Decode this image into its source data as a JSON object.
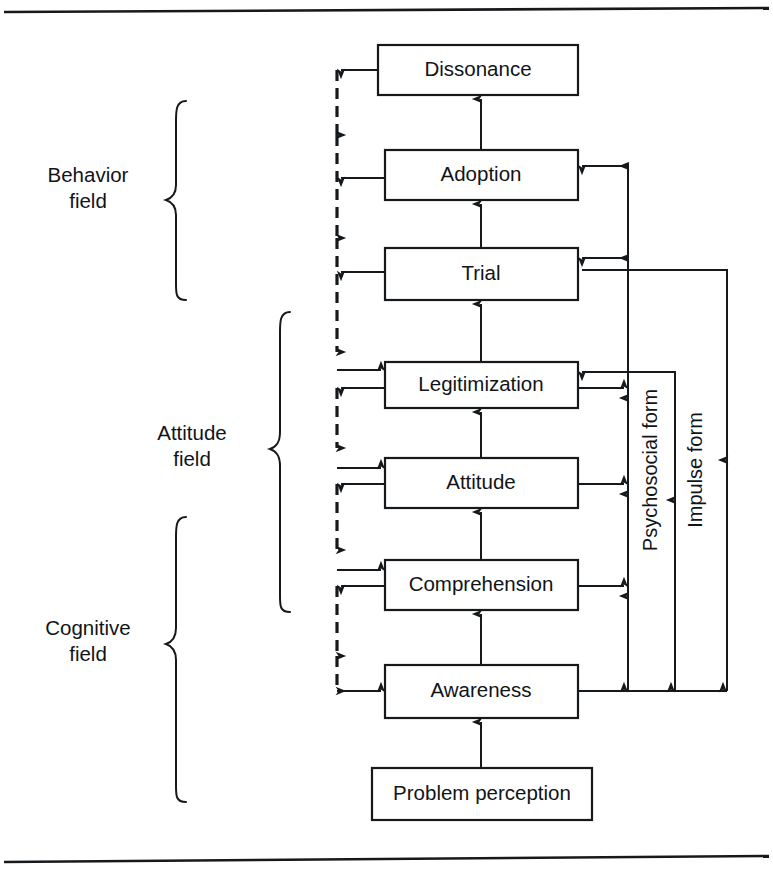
{
  "figure": {
    "background_color": "#ffffff",
    "line_color": "#16191c",
    "text_color": "#111417"
  },
  "rules": {
    "top_rule": "horizontal-rule",
    "bottom_rule": "horizontal-rule"
  },
  "nodes": [
    {
      "id": "dissonance",
      "label": "Dissonance",
      "x": 378,
      "y": 45,
      "w": 200,
      "h": 50
    },
    {
      "id": "adoption",
      "label": "Adoption",
      "x": 385,
      "y": 150,
      "w": 193,
      "h": 50
    },
    {
      "id": "trial",
      "label": "Trial",
      "x": 385,
      "y": 248,
      "w": 193,
      "h": 52
    },
    {
      "id": "legitimization",
      "label": "Legitimization",
      "x": 385,
      "y": 362,
      "w": 193,
      "h": 46
    },
    {
      "id": "attitude",
      "label": "Attitude",
      "x": 385,
      "y": 458,
      "w": 193,
      "h": 50
    },
    {
      "id": "comprehension",
      "label": "Comprehension",
      "x": 385,
      "y": 560,
      "w": 193,
      "h": 50
    },
    {
      "id": "awareness",
      "label": "Awareness",
      "x": 385,
      "y": 665,
      "w": 193,
      "h": 53
    },
    {
      "id": "problem_perception",
      "label": "Problem perception",
      "x": 372,
      "y": 768,
      "w": 220,
      "h": 52
    }
  ],
  "field_brackets": [
    {
      "id": "behavior",
      "label_line1": "Behavior",
      "label_line2": "field",
      "brace_x": 176,
      "top": 101,
      "bottom": 300,
      "label_x": 88,
      "label_y": 190
    },
    {
      "id": "attitude",
      "label_line1": "Attitude",
      "label_line2": "field",
      "brace_x": 280,
      "top": 312,
      "bottom": 612,
      "label_x": 192,
      "label_y": 447
    },
    {
      "id": "cognitive",
      "label_line1": "Cognitive",
      "label_line2": "field",
      "brace_x": 176,
      "top": 517,
      "bottom": 802,
      "label_x": 88,
      "label_y": 643
    }
  ],
  "rails": [
    {
      "id": "feedback_rail",
      "kind": "dashed",
      "x": 337,
      "label": ""
    },
    {
      "id": "psychosocial_rail",
      "kind": "solid",
      "x": 628,
      "label": "Psychosocial form",
      "label_x": 655,
      "label_y": 470
    },
    {
      "id": "impulse_rail",
      "kind": "solid",
      "x": 727,
      "label": "Impulse form",
      "label_x": 700,
      "label_y": 470
    }
  ],
  "edges": [
    {
      "from": "problem_perception",
      "to": "awareness",
      "type": "solid-up"
    },
    {
      "from": "awareness",
      "to": "comprehension",
      "type": "solid-up"
    },
    {
      "from": "comprehension",
      "to": "attitude",
      "type": "solid-up"
    },
    {
      "from": "attitude",
      "to": "legitimization",
      "type": "solid-up"
    },
    {
      "from": "legitimization",
      "to": "trial",
      "type": "solid-up"
    },
    {
      "from": "trial",
      "to": "adoption",
      "type": "solid-up"
    },
    {
      "from": "adoption",
      "to": "dissonance",
      "type": "solid-up"
    },
    {
      "from": "dissonance",
      "to": "feedback_rail",
      "type": "solid-left"
    },
    {
      "from": "adoption",
      "to": "feedback_rail",
      "type": "solid-left"
    },
    {
      "from": "trial",
      "to": "feedback_rail",
      "type": "solid-left"
    },
    {
      "from": "legitimization",
      "to": "feedback_rail",
      "type": "solid-left"
    },
    {
      "from": "attitude",
      "to": "feedback_rail",
      "type": "solid-left"
    },
    {
      "from": "comprehension",
      "to": "feedback_rail",
      "type": "solid-left"
    },
    {
      "from": "feedback_rail",
      "to": "legitimization",
      "type": "feed-right"
    },
    {
      "from": "feedback_rail",
      "to": "attitude",
      "type": "feed-right"
    },
    {
      "from": "feedback_rail",
      "to": "comprehension",
      "type": "feed-right"
    },
    {
      "from": "feedback_rail",
      "to": "awareness",
      "type": "feed-right"
    },
    {
      "from": "awareness",
      "to": "psychosocial_rail",
      "type": "solid-right"
    },
    {
      "from": "comprehension",
      "to": "psychosocial_rail",
      "type": "solid-right"
    },
    {
      "from": "attitude",
      "to": "psychosocial_rail",
      "type": "solid-right"
    },
    {
      "from": "legitimization",
      "to": "psychosocial_rail",
      "type": "solid-right"
    },
    {
      "from": "psychosocial_rail",
      "to": "trial",
      "type": "rail-left"
    },
    {
      "from": "psychosocial_rail",
      "to": "adoption",
      "type": "rail-left"
    },
    {
      "from": "awareness",
      "to": "impulse_rail",
      "type": "solid-right"
    },
    {
      "from": "impulse_rail",
      "to": "trial",
      "type": "rail-left"
    },
    {
      "from": "impulse_rail",
      "to": "legitimization",
      "type": "rail-left"
    }
  ]
}
